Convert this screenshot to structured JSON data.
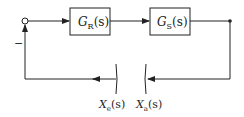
{
  "diagram": {
    "type": "block-diagram",
    "blocks": [
      {
        "id": "GR",
        "label_main": "G",
        "label_sub": "R",
        "label_arg": "(s)"
      },
      {
        "id": "GS",
        "label_main": "G",
        "label_sub": "S",
        "label_arg": "(s)"
      }
    ],
    "summing_junction": {
      "feedback_sign": "−"
    },
    "cut_signals": [
      {
        "id": "Xe",
        "label_main": "X",
        "label_sub": "e",
        "label_arg": "(s)"
      },
      {
        "id": "Xa",
        "label_main": "X",
        "label_sub": "a",
        "label_arg": "(s)"
      }
    ],
    "colors": {
      "stroke": "#222222",
      "block_fill": "#ffffff"
    }
  }
}
